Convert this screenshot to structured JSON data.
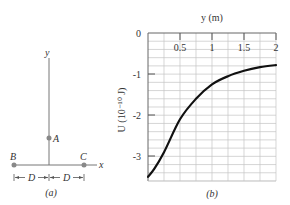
{
  "figure_a": {
    "caption": "(a)",
    "axis_x": "x",
    "axis_y": "y",
    "points": [
      {
        "label": "A",
        "position": "on y axis"
      },
      {
        "label": "B",
        "position": "x = -D"
      },
      {
        "label": "C",
        "position": "x = +D"
      }
    ],
    "dimension_label": "D"
  },
  "figure_b": {
    "caption": "(b)",
    "xlabel": "y (m)",
    "ylabel": "U (10⁻¹⁰ J)",
    "x_ticks": [
      "0.5",
      "1",
      "1.5",
      "2"
    ],
    "y_ticks": [
      "0",
      "-1",
      "-2",
      "-3"
    ]
  },
  "chart_data": {
    "type": "line",
    "title": "",
    "xlabel": "y (m)",
    "ylabel": "U (10^-10 J)",
    "xlim": [
      0,
      2
    ],
    "ylim": [
      -3.6,
      0
    ],
    "grid": true,
    "x_axis_position": "top",
    "series": [
      {
        "name": "U(y)",
        "x": [
          0,
          0.1,
          0.25,
          0.5,
          0.75,
          1.0,
          1.25,
          1.5,
          1.75,
          2.0
        ],
        "values": [
          -3.5,
          -3.3,
          -2.9,
          -2.1,
          -1.6,
          -1.25,
          -1.05,
          -0.92,
          -0.83,
          -0.78
        ]
      }
    ]
  },
  "colors": {
    "curve": "#111111",
    "grid": "#bbbbbb",
    "axis": "#555555",
    "charge": "#888888"
  }
}
